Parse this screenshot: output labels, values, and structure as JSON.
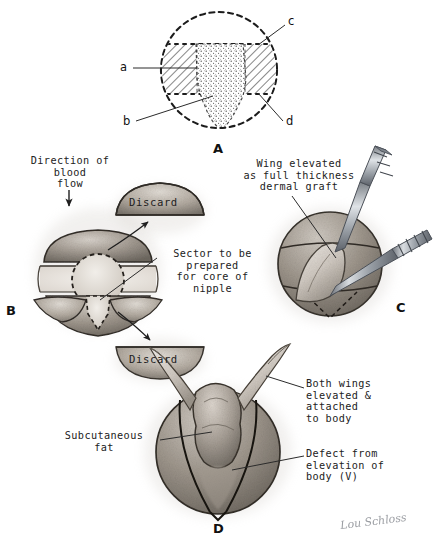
{
  "figure": {
    "background_color": "#ffffff",
    "ink_color": "#1a1a1a"
  },
  "panels": [
    {
      "id": "A",
      "letter": "A",
      "caption": "Cross-sectional plan of donor site showing wings and nipple core sector"
    },
    {
      "id": "B",
      "letter": "B",
      "caption": "Donor site with segments to discard and sector for core of nipple"
    },
    {
      "id": "C",
      "letter": "C",
      "caption": "Wing elevated as full thickness dermal graft with instruments"
    },
    {
      "id": "D",
      "letter": "D",
      "caption": "Both wings elevated and attached to body, defect from elevation"
    }
  ],
  "panel_a": {
    "letter": "A",
    "markers": [
      {
        "key": "a",
        "label": "a"
      },
      {
        "key": "b",
        "label": "b"
      },
      {
        "key": "c",
        "label": "c"
      },
      {
        "key": "d",
        "label": "d"
      }
    ]
  },
  "panel_b": {
    "letter": "B",
    "annotations": [
      {
        "name": "blood-flow",
        "text": "Direction of\nblood\nflow"
      },
      {
        "name": "sector-core",
        "text": "Sector to be\nprepared\nfor core of\nnipple"
      }
    ],
    "discard_upper": "Discard",
    "discard_lower": "Discard"
  },
  "panel_c": {
    "letter": "C",
    "annotations": [
      {
        "name": "wing-graft",
        "text": "Wing elevated\nas full thickness\ndermal graft"
      }
    ]
  },
  "panel_d": {
    "letter": "D",
    "annotations": [
      {
        "name": "subcutaneous-fat",
        "text": "Subcutaneous\nfat"
      },
      {
        "name": "both-wings",
        "text": "Both wings\nelevated &\nattached\nto body"
      },
      {
        "name": "defect",
        "text": "Defect from\nelevation of\nbody (V)"
      }
    ]
  },
  "signature": {
    "text": "Lou Schloss"
  },
  "colors": {
    "ink": "#1a1a1a",
    "tissue_mid": "#9a9289",
    "tissue_light": "#cfc8c0",
    "tissue_dark": "#6b655e",
    "instrument": "#8e9298",
    "shadow": "#b8b2ab"
  }
}
